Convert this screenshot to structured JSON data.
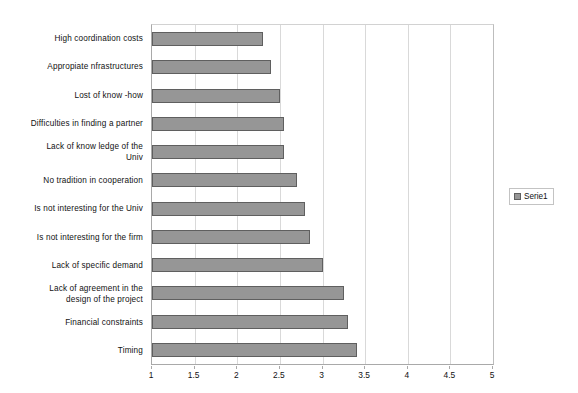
{
  "chart_data": {
    "type": "bar",
    "orientation": "horizontal",
    "title": "",
    "subtitle": "",
    "xlabel": "",
    "ylabel": "",
    "xlim": [
      1,
      5
    ],
    "xticks": [
      "1",
      "1.5",
      "2",
      "2.5",
      "3",
      "3.5",
      "4",
      "4.5",
      "5"
    ],
    "xtick_values": [
      1,
      1.5,
      2,
      2.5,
      3,
      3.5,
      4,
      4.5,
      5
    ],
    "grid": "vertical",
    "legend_position": "right",
    "categories": [
      "High coordination costs",
      "Appropiate nfrastructures",
      "Lost of know -how",
      "Difficulties in finding a partner",
      "Lack of know ledge of the\nUniv",
      "No tradition in cooperation",
      "Is not interesting for the Univ",
      "Is not interesting for the firm",
      "Lack of specific demand",
      "Lack of agreement in the\ndesign of the project",
      "Financial constraints",
      "Timing"
    ],
    "series": [
      {
        "name": "Serie1",
        "color": "#969696",
        "border_color": "#5f5f5f",
        "values": [
          2.3,
          2.4,
          2.5,
          2.55,
          2.55,
          2.7,
          2.8,
          2.85,
          3.0,
          3.25,
          3.3,
          3.4
        ]
      }
    ]
  },
  "legend": {
    "entries": [
      {
        "label": "Serie1",
        "swatch_color": "#969696"
      }
    ]
  },
  "colors": {
    "bar_fill": "#969696",
    "bar_border": "#5f5f5f",
    "gridline": "#d9d9d9",
    "axis_line": "#a9a9a9",
    "background": "#ffffff",
    "text": "#111111"
  }
}
